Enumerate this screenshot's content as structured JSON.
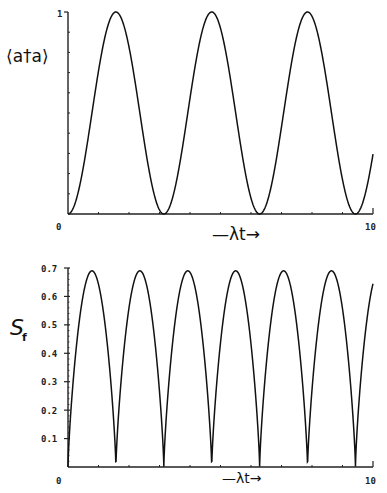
{
  "chart_data": [
    {
      "type": "line",
      "title": "",
      "ylabel": "⟨a†a⟩",
      "xlabel": "—λt→",
      "xlim": [
        0,
        10
      ],
      "ylim": [
        0,
        1
      ],
      "x_ticks": [
        "0",
        "10"
      ],
      "y_ticks": [
        "1"
      ],
      "grid": false,
      "series": [
        {
          "name": "⟨a†a⟩",
          "function": "sin^2(λt)",
          "x": [
            0,
            1.571,
            3.142,
            4.712,
            6.283,
            7.854,
            9.425,
            10
          ],
          "y": [
            0,
            1,
            0,
            1,
            0,
            1,
            0,
            0.3
          ]
        }
      ]
    },
    {
      "type": "line",
      "title": "",
      "ylabel": "S_f",
      "xlabel": "—λt→",
      "xlim": [
        0,
        10
      ],
      "ylim": [
        0,
        0.7
      ],
      "x_ticks": [
        "0",
        "10"
      ],
      "y_ticks": [
        "0.1",
        "0.2",
        "0.3",
        "0.4",
        "0.5",
        "0.6",
        "0.7"
      ],
      "grid": false,
      "series": [
        {
          "name": "S_f",
          "peak_value": 0.69,
          "period": 1.571,
          "x": [
            0,
            0.785,
            1.571,
            2.356,
            3.142,
            3.927,
            4.712,
            5.498,
            6.283,
            7.069,
            7.854,
            8.639,
            9.425,
            10
          ],
          "y": [
            0,
            0.69,
            0,
            0.69,
            0,
            0.69,
            0,
            0.69,
            0,
            0.69,
            0,
            0.69,
            0,
            0.55
          ]
        }
      ]
    }
  ],
  "top": {
    "ylabel": "⟨a†a⟩",
    "y_top": "1",
    "x_min": "0",
    "x_max": "10",
    "xlabel": "—λt→"
  },
  "bottom": {
    "ylabel_main": "S",
    "ylabel_sub": "f",
    "y_ticks": [
      "0.7",
      "0.6",
      "0.5",
      "0.4",
      "0.3",
      "0.2",
      "0.1"
    ],
    "x_min": "0",
    "x_max": "10",
    "xlabel": "—λt→"
  }
}
